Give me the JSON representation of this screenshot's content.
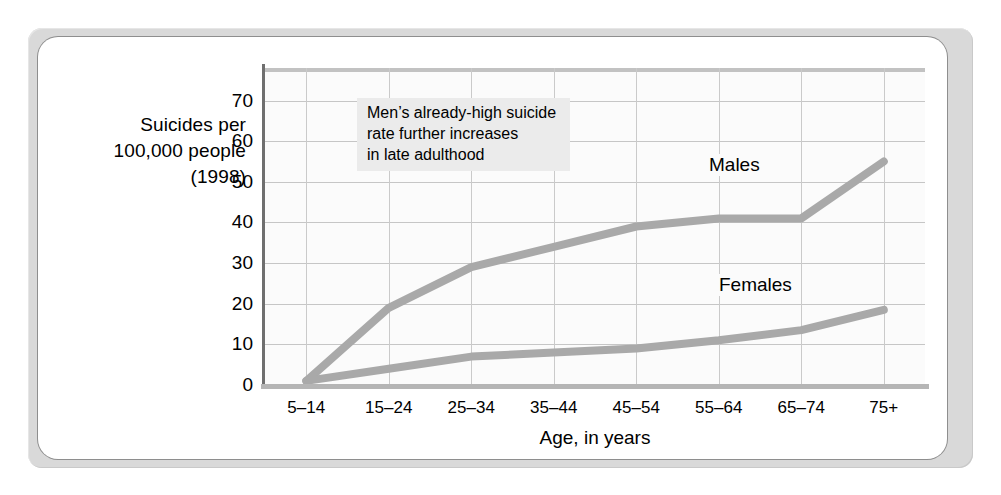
{
  "chart_data": {
    "type": "line",
    "title": "",
    "ylabel": "Suicides per 100,000 people (1998)",
    "ylabel_lines": [
      "Suicides per",
      "100,000 people",
      "(1998)"
    ],
    "xlabel": "Age, in years",
    "categories": [
      "5–14",
      "15–24",
      "25–34",
      "35–44",
      "45–54",
      "55–64",
      "65–74",
      "75+"
    ],
    "yticks": [
      0,
      10,
      20,
      30,
      40,
      50,
      60,
      70
    ],
    "ylim": [
      0,
      78
    ],
    "grid": true,
    "legend_position": "direct-labels",
    "series": [
      {
        "name": "Males",
        "values": [
          1,
          19,
          29,
          34,
          39,
          41,
          41,
          55
        ]
      },
      {
        "name": "Females",
        "values": [
          1,
          4,
          7,
          8,
          9,
          11,
          13.5,
          18.5
        ]
      }
    ],
    "annotations": [
      {
        "name": "males-late-adulthood-note",
        "lines": [
          "Men’s already-high suicide",
          "rate further increases",
          "in late adulthood"
        ]
      }
    ],
    "colors": {
      "series_line": "#a9a9a9",
      "grid": "#c6c6c6",
      "axis": "#6f6f6f",
      "plot_background": "#fbfbfb",
      "card_background": "#ffffff",
      "frame": "#d9d9d9",
      "annotation_background": "#ebebeb"
    }
  }
}
